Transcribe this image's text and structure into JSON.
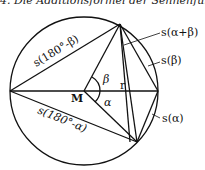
{
  "title": "4. Die Additionsformel der Sehnenfunktion",
  "labels": {
    "s_alpha_plus_beta": "s(α+β)",
    "s_beta": "s(β)",
    "s_alpha": "s(α)",
    "s_180_minus_beta": "s(180°-β)",
    "s_180_minus_alpha": "s(180°-α)",
    "center": "M",
    "radius": "r",
    "angle_alpha": "α",
    "angle_beta": "β"
  }
}
